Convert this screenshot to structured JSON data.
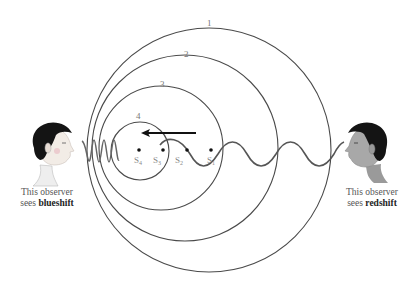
{
  "diagram": {
    "wavefronts": [
      {
        "label": "1",
        "cx": 209,
        "cy": 150,
        "r": 123
      },
      {
        "label": "2",
        "cx": 185,
        "cy": 148,
        "r": 93
      },
      {
        "label": "3",
        "cx": 161,
        "cy": 148,
        "r": 62
      },
      {
        "label": "4",
        "cx": 140,
        "cy": 151,
        "r": 29
      }
    ],
    "source_positions": [
      {
        "label": "S",
        "sub": "4",
        "x": 139,
        "y": 150
      },
      {
        "label": "S",
        "sub": "3",
        "x": 163,
        "y": 150
      },
      {
        "label": "S",
        "sub": "2",
        "x": 187,
        "y": 150
      },
      {
        "label": "S",
        "sub": "1",
        "x": 211,
        "y": 150
      }
    ],
    "motion_arrow": {
      "from_x": 196,
      "to_x": 141,
      "y": 133,
      "direction": "left"
    },
    "left_observer": {
      "caption_line1": "This observer",
      "caption_line2_prefix": "sees ",
      "caption_line2_bold": "blueshift"
    },
    "right_observer": {
      "caption_line1": "This observer",
      "caption_line2_prefix": "sees ",
      "caption_line2_bold": "redshift"
    },
    "colors": {
      "circle_stroke": "#4a4a4a",
      "wave_stroke": "#555555",
      "hair": "#141414",
      "skin_left": "#f2ece6",
      "skin_right": "#a8a8a8"
    }
  }
}
